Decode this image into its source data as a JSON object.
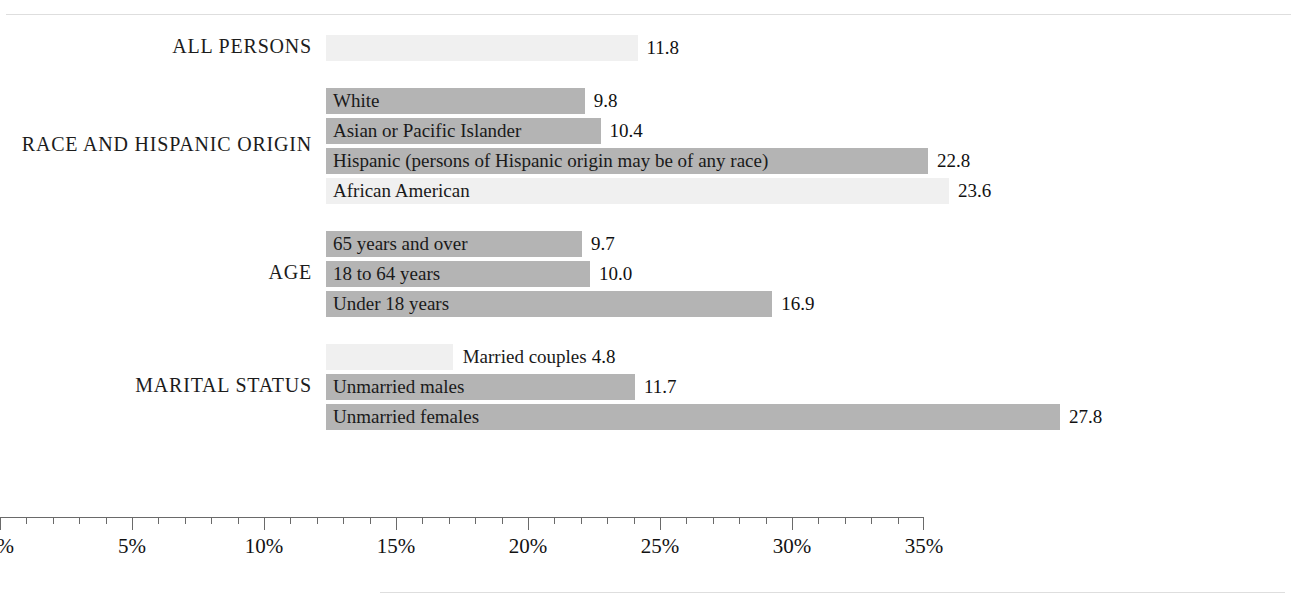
{
  "chart_data": {
    "type": "bar",
    "orientation": "horizontal",
    "title": "",
    "xlabel": "",
    "ylabel": "",
    "xlim": [
      0,
      35
    ],
    "xunit": "%",
    "grid": false,
    "legend": null,
    "axis": {
      "tick_labels": [
        "0%",
        "5%",
        "10%",
        "15%",
        "20%",
        "25%",
        "30%",
        "35%"
      ],
      "tick_values": [
        0,
        5,
        10,
        15,
        20,
        25,
        30,
        35
      ],
      "minor_tick_step": 1,
      "major_tick_step": 5
    },
    "groups": [
      {
        "name": "ALL PERSONS",
        "bars": [
          {
            "label": "",
            "value": 11.8,
            "value_text": "11.8",
            "shade": "light",
            "label_position": "none"
          }
        ]
      },
      {
        "name": "RACE AND HISPANIC ORIGIN",
        "bars": [
          {
            "label": "White",
            "value": 9.8,
            "value_text": "9.8",
            "shade": "mid",
            "label_position": "inside"
          },
          {
            "label": "Asian or Pacific Islander",
            "value": 10.4,
            "value_text": "10.4",
            "shade": "mid",
            "label_position": "inside"
          },
          {
            "label": "Hispanic (persons of Hispanic origin may be of any race)",
            "value": 22.8,
            "value_text": "22.8",
            "shade": "mid",
            "label_position": "inside"
          },
          {
            "label": "African American",
            "value": 23.6,
            "value_text": "23.6",
            "shade": "light",
            "label_position": "inside"
          }
        ]
      },
      {
        "name": "AGE",
        "bars": [
          {
            "label": "65 years and over",
            "value": 9.7,
            "value_text": "9.7",
            "shade": "mid",
            "label_position": "inside"
          },
          {
            "label": "18 to 64 years",
            "value": 10.0,
            "value_text": "10.0",
            "shade": "mid",
            "label_position": "inside"
          },
          {
            "label": "Under 18 years",
            "value": 16.9,
            "value_text": "16.9",
            "shade": "mid",
            "label_position": "inside"
          }
        ]
      },
      {
        "name": "MARITAL STATUS",
        "bars": [
          {
            "label": "Married couples",
            "value": 4.8,
            "value_text": "4.8",
            "shade": "light",
            "label_position": "outside"
          },
          {
            "label": "Unmarried males",
            "value": 11.7,
            "value_text": "11.7",
            "shade": "mid",
            "label_position": "inside"
          },
          {
            "label": "Unmarried females",
            "value": 27.8,
            "value_text": "27.8",
            "shade": "mid",
            "label_position": "inside"
          }
        ]
      }
    ],
    "colors": {
      "bar_mid": "#b4b4b4",
      "bar_light": "#f0f0f0",
      "axis": "#6a6a6a",
      "text": "#1a1a1a",
      "rule": "#dedede",
      "background": "#ffffff"
    }
  }
}
